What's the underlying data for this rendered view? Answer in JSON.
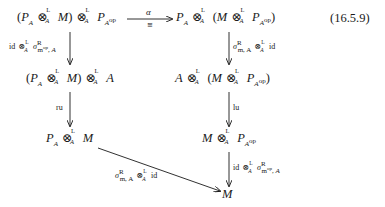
{
  "equation_number": "(16.5.9)",
  "nodes": {
    "top_left": "(P_A ⊗^L_A M) ⊗^L_A P_{A^op}",
    "top_right": "P_A ⊗^L_A (M ⊗^L_A P_{A^op})",
    "mid_left": "(P_A ⊗^L_A M) ⊗^L_A A",
    "mid_right": "A ⊗^L_A (M ⊗^L_A P_{A^op})",
    "low_left": "P_A ⊗^L_A M",
    "low_right": "M ⊗^L_A P_{A^op}",
    "bottom": "M"
  },
  "arrows": {
    "top_horizontal": {
      "label_above": "α",
      "label_below": "≅"
    },
    "left_1": {
      "label": "id ⊗^L_A σ^R_{m^op,A}"
    },
    "left_2": {
      "label": "ru"
    },
    "right_1": {
      "label": "σ^R_{m,A} ⊗^L_A id"
    },
    "right_2": {
      "label": "lu"
    },
    "right_3": {
      "label": "id ⊗^L_A σ^R_{m^op,A}"
    },
    "diagonal": {
      "label": "σ^R_{m,A} ⊗^L_A id"
    }
  },
  "text": {
    "P": "P",
    "A": "A",
    "M": "M",
    "Aop": "A",
    "op": "op",
    "L": "L",
    "otimes": "⊗",
    "lp": "(",
    "rp": ")",
    "alpha": "α",
    "cong": "≅",
    "id": "id",
    "sigma": "σ",
    "R": "R",
    "mop_A": "m",
    "op_sub": "op",
    "comma_A": ", A",
    "m_A": "m, A",
    "ru": "ru",
    "lu": "lu"
  }
}
